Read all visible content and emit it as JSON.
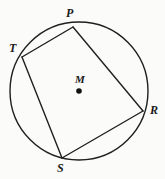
{
  "figure": {
    "kind": "cyclic-quadrilateral-in-circle",
    "background_color": "#fbfbfa",
    "stroke_color": "#1f1f1f",
    "label_color": "#1a1a1a",
    "circle": {
      "center_label": "M",
      "center_x": 79,
      "center_y": 91,
      "radius": 69,
      "stroke_width": 1.4
    },
    "center_dot": {
      "radius": 2.8,
      "fill": "#101010"
    },
    "vertices": [
      {
        "id": "P",
        "label": "P",
        "x": 73,
        "y": 27,
        "label_x": 66,
        "label_y": 7
      },
      {
        "id": "T",
        "label": "T",
        "x": 22,
        "y": 57,
        "label_x": 9,
        "label_y": 42
      },
      {
        "id": "S",
        "label": "S",
        "x": 62,
        "y": 158,
        "label_x": 57,
        "label_y": 162
      },
      {
        "id": "R",
        "label": "R",
        "x": 143,
        "y": 111,
        "label_x": 150,
        "label_y": 104
      }
    ],
    "chords": [
      {
        "id": "chord-TP",
        "from": "T",
        "to": "P"
      },
      {
        "id": "chord-PR",
        "from": "P",
        "to": "R"
      },
      {
        "id": "chord-RS",
        "from": "R",
        "to": "S"
      },
      {
        "id": "chord-ST",
        "from": "S",
        "to": "T"
      }
    ],
    "chord_stroke_width": 1.4
  }
}
